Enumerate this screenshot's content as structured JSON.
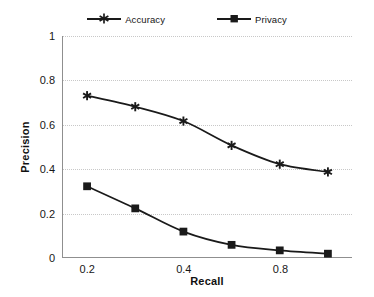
{
  "chart_data": {
    "type": "line",
    "title": "",
    "xlabel": "Recall",
    "ylabel": "Precision",
    "categories": [
      "0.2",
      "0.3",
      "0.4",
      "0.6",
      "0.8",
      "0.9"
    ],
    "x_tick_labels": [
      "0.2",
      "",
      "0.4",
      "",
      "0.8",
      ""
    ],
    "y_tick_labels": [
      "0",
      "0.2",
      "0.4",
      "0.6",
      "0.8",
      "1"
    ],
    "y_tick_values": [
      0,
      0.2,
      0.4,
      0.6,
      0.8,
      1
    ],
    "ylim": [
      0,
      1
    ],
    "grid": "horizontal-dotted",
    "legend_position": "top-center",
    "series": [
      {
        "name": "Accuracy",
        "marker": "star-icon",
        "color": "#1a1a1a",
        "values": [
          0.73,
          0.68,
          0.615,
          0.505,
          0.42,
          0.385
        ]
      },
      {
        "name": "Privacy",
        "marker": "square-icon",
        "color": "#1a1a1a",
        "values": [
          0.32,
          0.22,
          0.115,
          0.055,
          0.03,
          0.015
        ]
      }
    ]
  },
  "legend": {
    "entries": [
      {
        "label": "Accuracy"
      },
      {
        "label": "Privacy"
      }
    ]
  },
  "axes": {
    "y": {
      "label": "Precision",
      "ticks": [
        "0",
        "0.2",
        "0.4",
        "0.6",
        "0.8",
        "1"
      ]
    },
    "x": {
      "label": "Recall",
      "ticks": [
        "0.2",
        "0.4",
        "0.8"
      ]
    }
  },
  "colors": {
    "series_line": "#1a1a1a",
    "gridline": "#c8c8c8",
    "axis": "#8f8f8f",
    "background": "#ffffff"
  }
}
